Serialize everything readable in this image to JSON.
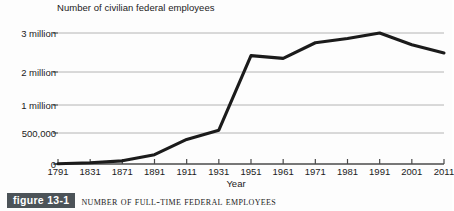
{
  "figure": {
    "badge_label": "figure 13-1",
    "caption": "Number of Full-Time Federal Employees",
    "badge_color": "#4c5358",
    "badge_text_color": "#ffffff"
  },
  "chart_data": {
    "type": "line",
    "title": "Number of civilian federal employees",
    "xlabel": "Year",
    "ylabel": "",
    "grid": true,
    "legend": "none",
    "line_color": "#1b1b1b",
    "gridline_color": "#b4b4b4",
    "axis_color": "#4a4a4a",
    "categories": [
      "1791",
      "1831",
      "1871",
      "1891",
      "1911",
      "1931",
      "1951",
      "1961",
      "1971",
      "1981",
      "1991",
      "2001",
      "2011"
    ],
    "y_tick_labels": [
      "0",
      "500,000",
      "1 million",
      "2 million",
      "3 million"
    ],
    "y_tick_values": [
      0,
      500000,
      1000000,
      2000000,
      3000000
    ],
    "y_axis_note": "non-linear spacing: 500,000 gridline sits between 0 and 1 million",
    "ylim": [
      0,
      3000000
    ],
    "series": [
      {
        "name": "Number of civilian federal employees",
        "values": [
          4500,
          20000,
          51000,
          150000,
          396000,
          550000,
          2420000,
          2350000,
          2750000,
          2860000,
          3000000,
          2700000,
          2490000
        ]
      }
    ],
    "points": [
      {
        "x": "1791",
        "y": 4500
      },
      {
        "x": "1831",
        "y": 20000
      },
      {
        "x": "1871",
        "y": 51000
      },
      {
        "x": "1891",
        "y": 150000
      },
      {
        "x": "1911",
        "y": 396000
      },
      {
        "x": "1931",
        "y": 550000
      },
      {
        "x": "1951",
        "y": 2420000
      },
      {
        "x": "1961",
        "y": 2350000
      },
      {
        "x": "1971",
        "y": 2750000
      },
      {
        "x": "1981",
        "y": 2860000
      },
      {
        "x": "1991",
        "y": 3000000
      },
      {
        "x": "2001",
        "y": 2700000
      },
      {
        "x": "2011",
        "y": 2490000
      }
    ]
  }
}
